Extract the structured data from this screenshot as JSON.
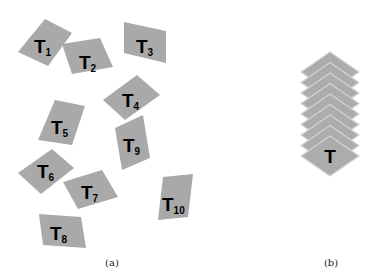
{
  "figure": {
    "panel_a": {
      "caption": "(a)",
      "tiles": [
        {
          "main": "T",
          "sub": "1",
          "points": "45,19 72,33 48,66 18,52",
          "lx": 34,
          "ly": 53
        },
        {
          "main": "T",
          "sub": "2",
          "points": "62,44 100,38 113,67 72,74",
          "lx": 79,
          "ly": 69
        },
        {
          "main": "T",
          "sub": "3",
          "points": "124,22 166,31 166,63 124,53",
          "lx": 136,
          "ly": 53
        },
        {
          "main": "T",
          "sub": "4",
          "points": "137,75 160,95 125,120 103,100",
          "lx": 122,
          "ly": 107
        },
        {
          "main": "T",
          "sub": "5",
          "points": "55,100 85,106 72,145 38,140",
          "lx": 51,
          "ly": 134
        },
        {
          "main": "T",
          "sub": "6",
          "points": "52,149 74,168 41,194 18,173",
          "lx": 37,
          "ly": 178
        },
        {
          "main": "T",
          "sub": "7",
          "points": "63,182 102,170 118,197 78,209",
          "lx": 81,
          "ly": 199
        },
        {
          "main": "T",
          "sub": "8",
          "points": "39,214 81,217 86,248 43,245",
          "lx": 50,
          "ly": 240
        },
        {
          "main": "T",
          "sub": "9",
          "points": "115,128 143,115 150,158 122,170",
          "lx": 123,
          "ly": 152
        },
        {
          "main": "T",
          "sub": "10",
          "points": "163,177 193,174 188,217 158,220",
          "lx": 162,
          "ly": 211
        }
      ]
    },
    "panel_b": {
      "caption": "(b)",
      "label": "T",
      "stack_count": 9,
      "center_x": 330,
      "top_y": 52,
      "offset": 10.5,
      "half_w": 29,
      "half_h": 20
    }
  },
  "colors": {
    "tile": "#a9a9a9",
    "stack_tile": "#acacac",
    "stack_edge": "#d4d4d4",
    "text": "#000000"
  }
}
